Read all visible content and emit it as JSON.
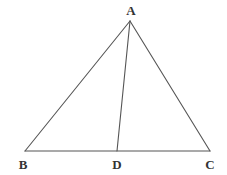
{
  "figure": {
    "kind": "geometry-diagram",
    "background_color": "#ffffff",
    "stroke_color": "#555555",
    "stroke_width": 1.1,
    "label_color": "#333333",
    "canvas": {
      "width": 227,
      "height": 175
    },
    "points": {
      "A": {
        "label": "A",
        "x": 130,
        "y": 21,
        "label_x": 131,
        "label_y": 10
      },
      "B": {
        "label": "B",
        "x": 25,
        "y": 151,
        "label_x": 23,
        "label_y": 164
      },
      "C": {
        "label": "C",
        "x": 210,
        "y": 151,
        "label_x": 210,
        "label_y": 164
      },
      "D": {
        "label": "D",
        "x": 117,
        "y": 151,
        "label_x": 117,
        "label_y": 164
      }
    },
    "segments": [
      {
        "name": "segment-AB",
        "from": "A",
        "to": "B"
      },
      {
        "name": "segment-AC",
        "from": "A",
        "to": "C"
      },
      {
        "name": "segment-BC",
        "from": "B",
        "to": "C"
      },
      {
        "name": "segment-AD",
        "from": "A",
        "to": "D"
      }
    ]
  }
}
